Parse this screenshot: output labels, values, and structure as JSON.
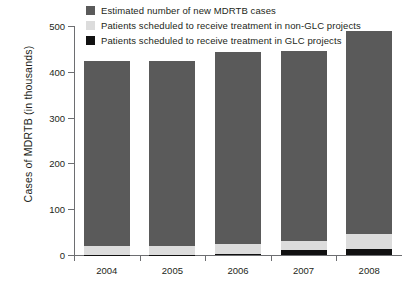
{
  "chart_data": {
    "type": "bar",
    "subtype": "stacked",
    "title": "",
    "xlabel": "",
    "ylabel": "Cases of MDRTB (in thousands)",
    "categories": [
      "2004",
      "2005",
      "2006",
      "2007",
      "2008"
    ],
    "ylim": [
      0,
      500
    ],
    "yticks": [
      0,
      100,
      200,
      300,
      400,
      500
    ],
    "ytick_labels": [
      "0",
      "100",
      "200",
      "300",
      "400",
      "500"
    ],
    "grid": false,
    "legend_position": "top",
    "series": [
      {
        "name": "Estimated number of new MDRTB cases",
        "color": "#5a5a5a",
        "values": [
          424,
          423,
          443,
          445,
          489
        ]
      },
      {
        "name": "Patients scheduled to receive treatment in non-GLC projects",
        "color": "#dcdcdc",
        "values": [
          20,
          20,
          25,
          30,
          45
        ]
      },
      {
        "name": "Patients scheduled to receive treatment in GLC projects",
        "color": "#111111",
        "values": [
          1,
          1,
          3,
          11,
          14
        ]
      }
    ]
  },
  "legend": {
    "items": [
      {
        "label": "Estimated number of new MDRTB cases",
        "color": "#5a5a5a",
        "icon": "legend-swatch"
      },
      {
        "label": "Patients scheduled to receive treatment in non-GLC projects",
        "color": "#dcdcdc",
        "icon": "legend-swatch"
      },
      {
        "label": "Patients scheduled to receive treatment in GLC projects",
        "color": "#111111",
        "icon": "legend-swatch"
      }
    ]
  },
  "axes": {
    "y_title": "Cases of MDRTB (in thousands)"
  }
}
